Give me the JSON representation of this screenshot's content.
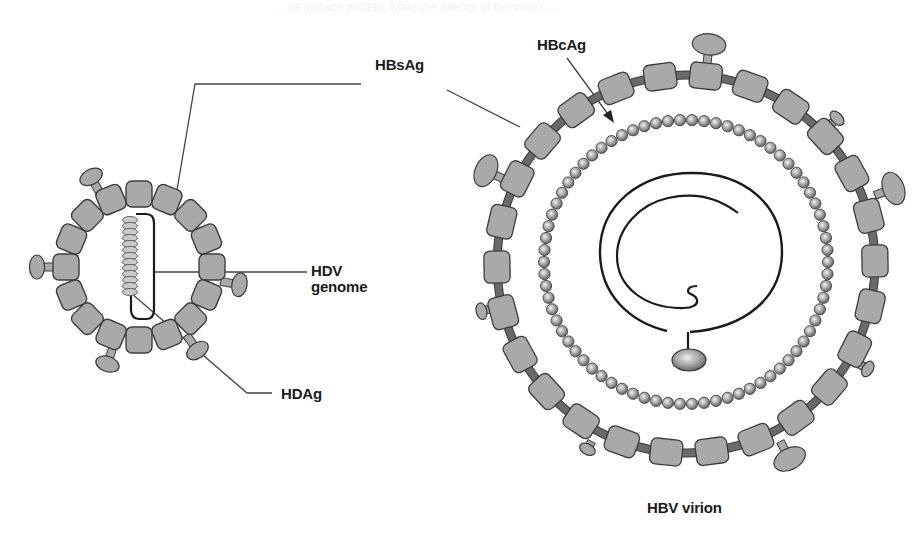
{
  "diagram": {
    "type": "virion-structure-comparison",
    "colors": {
      "background": "#ffffff",
      "surface_block": "#a9a9a9",
      "block_outline": "#3c3c3c",
      "connector": "#6a6a6a",
      "leader_line": "#444444",
      "genome_line": "#1a1a1a",
      "bead_fill_light": "#e8e8e8",
      "bead_fill_dark": "#6e6e6e",
      "label_text": "#1a1a1a"
    },
    "bleed_text": "... its surface protein, while the interior of the virion ...",
    "labels": {
      "hbsag": "HBsAg",
      "hbcag": "HBcAg",
      "hdv_genome_line1": "HDV",
      "hdv_genome_line2": "genome",
      "hdag": "HDAg",
      "hbv_virion": "HBV virion"
    },
    "hdv_particle": {
      "name": "HDV particle",
      "center": [
        139,
        267
      ],
      "block_ring_radius": 73,
      "block_count": 16,
      "block_size": 26,
      "knob_angles_deg": [
        -118,
        10,
        180,
        55,
        108
      ],
      "genome_beads": 13,
      "components": [
        "HBsAg envelope",
        "HDV genome",
        "HDAg"
      ]
    },
    "hbv_virion": {
      "name": "HBV virion",
      "center": [
        686,
        264
      ],
      "envelope_radius": 189,
      "envelope_block_count": 26,
      "core_bead_radius": 142,
      "core_bead_count": 74,
      "knob_angles_deg": [
        -84,
        -44,
        -20,
        167,
        205,
        118,
        62,
        30
      ],
      "components": [
        "HBsAg envelope",
        "HBcAg core",
        "partially double-stranded DNA genome",
        "polymerase"
      ]
    }
  }
}
